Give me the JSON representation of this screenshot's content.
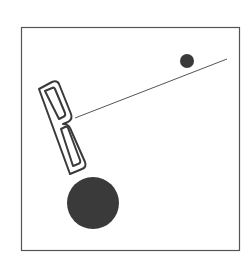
{
  "figure": {
    "letter": "B",
    "colors": {
      "background": "#ffffff",
      "frame": "#555555",
      "shape_fill": "#3a3a3a",
      "line": "#555555"
    },
    "elements": [
      {
        "type": "frame",
        "x": 21,
        "y": 27,
        "width": 219,
        "height": 224
      },
      {
        "type": "letter-outline",
        "label": "B",
        "rotation_deg": -18
      },
      {
        "type": "line",
        "x1": 75,
        "y1": 118,
        "x2": 227,
        "y2": 59
      },
      {
        "type": "dot",
        "cx": 187,
        "cy": 61,
        "r": 7
      },
      {
        "type": "circle",
        "cx": 93,
        "cy": 203,
        "r": 26
      }
    ]
  }
}
